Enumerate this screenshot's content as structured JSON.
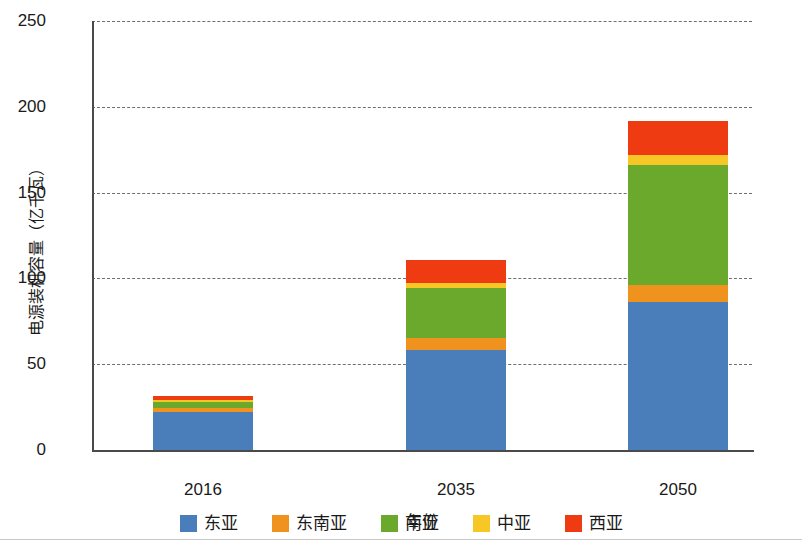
{
  "chart_data": {
    "type": "bar",
    "stacked": true,
    "title": "",
    "xlabel": "年份",
    "ylabel": "电源装机容量（亿千瓦）",
    "categories": [
      "2016",
      "2035",
      "2050"
    ],
    "ylim": [
      0,
      250
    ],
    "yticks": [
      0,
      50,
      100,
      150,
      200,
      250
    ],
    "ytick_labels": [
      "0",
      "50",
      "100",
      "150",
      "200",
      "250"
    ],
    "grid": true,
    "legend_position": "bottom",
    "series": [
      {
        "name": "东亚",
        "color": "#4a7ebb",
        "values": [
          22.0,
          58.0,
          86.0
        ]
      },
      {
        "name": "东南亚",
        "color": "#f0921e",
        "values": [
          2.5,
          7.5,
          10.0
        ]
      },
      {
        "name": "南亚",
        "color": "#6aa92b",
        "values": [
          3.5,
          29.0,
          70.0
        ]
      },
      {
        "name": "中亚",
        "color": "#f6c725",
        "values": [
          1.0,
          3.0,
          6.0
        ]
      },
      {
        "name": "西亚",
        "color": "#ee3b11",
        "values": [
          2.5,
          13.0,
          20.0
        ]
      }
    ],
    "totals": [
      31.5,
      110.5,
      192.0
    ]
  },
  "axis": {
    "y_title": "电源装机容量（亿千瓦）",
    "x_title": "年份",
    "y_labels": [
      "250",
      "200",
      "150",
      "100",
      "50",
      "0"
    ],
    "x_labels": [
      "2016",
      "2035",
      "2050"
    ]
  },
  "legend": {
    "items": [
      {
        "label": "东亚",
        "color": "#4a7ebb"
      },
      {
        "label": "东南亚",
        "color": "#f0921e"
      },
      {
        "label": "南亚",
        "color": "#6aa92b"
      },
      {
        "label": "中亚",
        "color": "#f6c725"
      },
      {
        "label": "西亚",
        "color": "#ee3b11"
      }
    ]
  }
}
